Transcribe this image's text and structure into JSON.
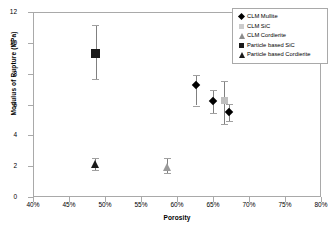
{
  "chart_data": {
    "type": "scatter",
    "title": "",
    "xlabel": "Porosity",
    "ylabel": "Modulus of Rupture (MPa)",
    "xlim": [
      40,
      80
    ],
    "ylim": [
      0,
      12
    ],
    "xticks": [
      "40%",
      "45%",
      "50%",
      "55%",
      "60%",
      "65%",
      "70%",
      "75%",
      "80%"
    ],
    "xtick_values": [
      40,
      45,
      50,
      55,
      60,
      65,
      70,
      75,
      80
    ],
    "yticks": [
      "0",
      "2",
      "4",
      "6",
      "8",
      "10",
      "12"
    ],
    "ytick_values": [
      0,
      2,
      4,
      6,
      8,
      10,
      12
    ],
    "grid": false,
    "legend_position": "top-right",
    "series": [
      {
        "name": "CLM Mullite",
        "marker": "diamond",
        "color": "#000000",
        "points": [
          {
            "x": 62.5,
            "y": 7.3,
            "yerr_low": 6.0,
            "yerr_high": 8.0
          },
          {
            "x": 64.9,
            "y": 6.3,
            "yerr_low": 5.5,
            "yerr_high": 7.0
          },
          {
            "x": 67.1,
            "y": 5.6,
            "yerr_low": 5.0,
            "yerr_high": 6.1
          }
        ]
      },
      {
        "name": "CLM SiC",
        "marker": "square",
        "color": "#bfbfbf",
        "points": [
          {
            "x": 66.4,
            "y": 6.3,
            "yerr_low": 4.8,
            "yerr_high": 7.6
          }
        ]
      },
      {
        "name": "CLM Cordierite",
        "marker": "triangle",
        "color": "#9a9a9a",
        "points": [
          {
            "x": 58.5,
            "y": 2.0,
            "yerr_low": 1.6,
            "yerr_high": 2.6
          }
        ]
      },
      {
        "name": "Particle based SiC",
        "marker": "square",
        "color": "#1a1a1a",
        "points": [
          {
            "x": 48.6,
            "y": 9.4,
            "yerr_low": 7.7,
            "yerr_high": 11.2
          }
        ]
      },
      {
        "name": "Particle based Cordierite",
        "marker": "triangle",
        "color": "#1a1a1a",
        "points": [
          {
            "x": 48.5,
            "y": 2.2,
            "yerr_low": 1.8,
            "yerr_high": 2.6
          }
        ]
      }
    ]
  },
  "legend": {
    "items": [
      {
        "label": "CLM Mullite",
        "key": "lk-diamond"
      },
      {
        "label": "CLM SiC",
        "key": "lk-square-grey"
      },
      {
        "label": "CLM Cordierite",
        "key": "lk-triangle-grey"
      },
      {
        "label": "Particle based SiC",
        "key": "lk-square-black"
      },
      {
        "label": "Particle based Cordierite",
        "key": "lk-triangle-black"
      }
    ]
  }
}
